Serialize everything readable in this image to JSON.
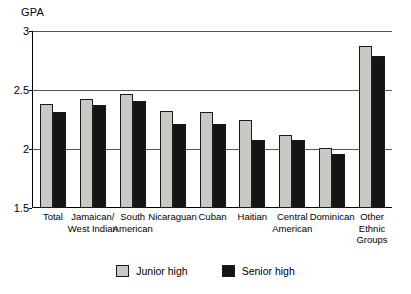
{
  "chart_data": {
    "type": "bar",
    "title": "",
    "xlabel": "",
    "ylabel": "GPA",
    "ylim": [
      1.5,
      3
    ],
    "yticks": [
      "1.5",
      "2",
      "2.5",
      "3"
    ],
    "grid": true,
    "legend_position": "bottom",
    "categories": [
      "Total",
      "Jamaican/\nWest Indian",
      "South\nAmerican",
      "Nicaraguan",
      "Cuban",
      "Haitian",
      "Central\nAmerican",
      "Dominican",
      "Other\nEthnic\nGroups"
    ],
    "series": [
      {
        "name": "Junior high",
        "color": "#c9c9c4",
        "values": [
          2.38,
          2.42,
          2.47,
          2.32,
          2.31,
          2.25,
          2.12,
          2.01,
          2.87
        ]
      },
      {
        "name": "Senior high",
        "color": "#141414",
        "values": [
          2.31,
          2.37,
          2.41,
          2.21,
          2.21,
          2.08,
          2.08,
          1.96,
          2.79
        ]
      }
    ]
  },
  "axis": {
    "y_title": "GPA"
  },
  "legend": {
    "items": [
      {
        "label": "Junior high"
      },
      {
        "label": "Senior high"
      }
    ]
  }
}
